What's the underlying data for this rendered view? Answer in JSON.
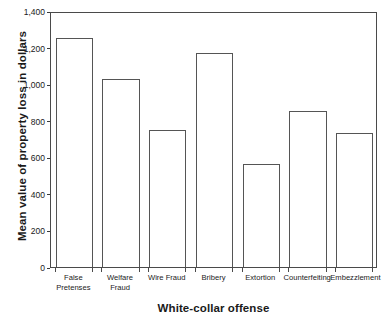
{
  "chart_data": {
    "type": "bar",
    "title": "",
    "xlabel": "White-collar offense",
    "ylabel": "Mean value of property loss in dollars",
    "categories": [
      "False\nPretenses",
      "Welfare Fraud",
      "Wire Fraud",
      "Bribery",
      "Extortion",
      "Counterfeiting",
      "Embezzlement"
    ],
    "values": [
      1250,
      1030,
      750,
      1170,
      565,
      855,
      735
    ],
    "ylim": [
      0,
      1400
    ],
    "yticks": [
      0,
      200,
      400,
      600,
      800,
      1000,
      1200,
      1400
    ],
    "ytick_labels": [
      "0",
      "200",
      "400",
      "600",
      "800",
      "1,000",
      "1,200",
      "1,400"
    ],
    "grid": false,
    "legend": false,
    "bar_style": {
      "fill": "#ffffff",
      "edge": "#555555"
    },
    "frame_color": "#4a4a4a",
    "text_color": "#1a1a1a"
  }
}
